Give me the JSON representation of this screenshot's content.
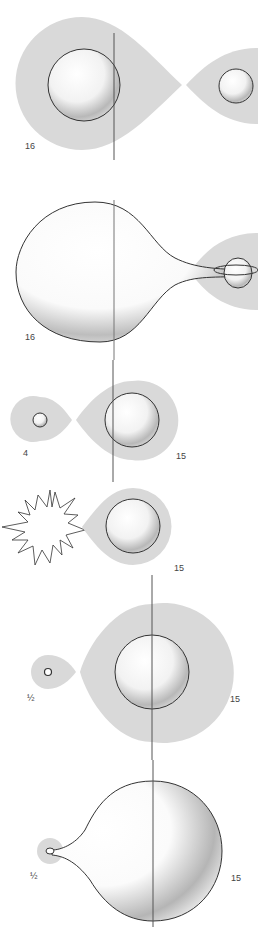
{
  "diagram": {
    "type": "binary star evolution sequence",
    "colors": {
      "roche_lobe_fill": "#d9d9d9",
      "outline": "#333333",
      "axis_line": "#555555",
      "background": "#ffffff"
    },
    "panels": [
      {
        "id": "panel-1",
        "primary_mass_label": "16",
        "description": "Two stars in detached binary, each inside its Roche lobe"
      },
      {
        "id": "panel-2",
        "primary_mass_label": "16",
        "description": "Primary expands, fills Roche lobe and transfers mass to companion with accretion disk"
      },
      {
        "id": "panel-3",
        "primary_mass_label": "4",
        "secondary_mass_label": "15",
        "description": "Mass ratio reversed; small remnant and massive companion"
      },
      {
        "id": "panel-4",
        "secondary_mass_label": "15",
        "description": "Remnant explodes as supernova"
      },
      {
        "id": "panel-5",
        "primary_mass_label": "½",
        "secondary_mass_label": "15",
        "description": "Compact object orbiting massive star"
      },
      {
        "id": "panel-6",
        "primary_mass_label": "½",
        "secondary_mass_label": "15",
        "description": "Massive star expands and transfers mass onto compact object"
      }
    ]
  }
}
